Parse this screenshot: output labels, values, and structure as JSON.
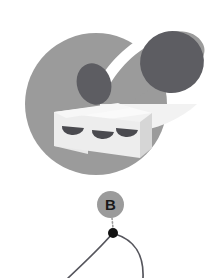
{
  "canvas": {
    "width": 217,
    "height": 278,
    "background": "#ffffff"
  },
  "illustration": {
    "name": "food-plate-illustration",
    "description": "Abstract grey-tone illustration of a sliced roll on a tray inside a round disc",
    "colors": {
      "disc_gray": "#9b9b9b",
      "arm_gray": "#9b9b9b",
      "blob_dark": "#5d5d62",
      "tray_top": "#fafafa",
      "tray_front": "#e8e8e8",
      "tray_side": "#d6d6d6",
      "blade_light": "#f2f2f2",
      "cut_dark": "#4a4a4f"
    },
    "parts": [
      {
        "label": "disc",
        "shape": "circle"
      },
      {
        "label": "arm",
        "shape": "tapered-band"
      },
      {
        "label": "blob-large",
        "shape": "ellipse"
      },
      {
        "label": "blob-small",
        "shape": "ellipse"
      },
      {
        "label": "tray",
        "shape": "prism"
      },
      {
        "label": "slice-1",
        "shape": "half-disc"
      },
      {
        "label": "slice-2",
        "shape": "half-disc"
      },
      {
        "label": "slice-3",
        "shape": "half-disc"
      },
      {
        "label": "blade",
        "shape": "wedge"
      }
    ]
  },
  "annotation": {
    "badge": {
      "label": "B",
      "fill": "#9b9b9b",
      "text_color": "#1a1a1a",
      "cx": 110.5,
      "cy": 204.5,
      "r": 13.5
    },
    "leader_line": {
      "style": "dotted",
      "color": "#9b9b9b",
      "from_y": 218,
      "to_y": 229
    },
    "node": {
      "label": "",
      "color": "#111111",
      "cx": 113,
      "cy": 233,
      "r": 5
    },
    "edges": [
      {
        "name": "edge-left",
        "color": "#55555c",
        "width": 1.7
      },
      {
        "name": "edge-right",
        "color": "#55555c",
        "width": 1.7
      }
    ]
  }
}
